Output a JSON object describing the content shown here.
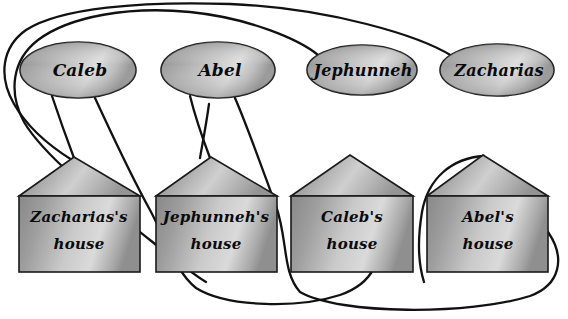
{
  "diagram": {
    "type": "bipartite-mapping",
    "background_color": "#ffffff",
    "line_color": "#111111",
    "shape_fill_light": "#d6d6d6",
    "shape_fill_dark": "#8a8a8a",
    "people": [
      {
        "id": "caleb",
        "label": "Caleb",
        "cx": 78,
        "cy": 70,
        "rx": 58,
        "ry": 28
      },
      {
        "id": "abel",
        "label": "Abel",
        "cx": 218,
        "cy": 70,
        "rx": 57,
        "ry": 28
      },
      {
        "id": "jephunneh",
        "label": "Jephunneh",
        "cx": 362,
        "cy": 70,
        "rx": 55,
        "ry": 25
      },
      {
        "id": "zacharias",
        "label": "Zacharias",
        "cx": 497,
        "cy": 70,
        "rx": 57,
        "ry": 26
      }
    ],
    "houses": [
      {
        "id": "zacharias-house",
        "owner": "Zacharias",
        "line1": "Zacharias's",
        "line2": "house",
        "left": 19,
        "right": 140,
        "apex_x": 74,
        "apex_y": 157,
        "eave_y": 196,
        "bottom_y": 272
      },
      {
        "id": "jephunneh-house",
        "owner": "Jephunneh",
        "line1": "Jephunneh's",
        "line2": "house",
        "left": 156,
        "right": 277,
        "apex_x": 211,
        "apex_y": 157,
        "eave_y": 196,
        "bottom_y": 272
      },
      {
        "id": "caleb-house",
        "owner": "Caleb",
        "line1": "Caleb's",
        "line2": "house",
        "left": 291,
        "right": 413,
        "apex_x": 350,
        "apex_y": 155,
        "eave_y": 196,
        "bottom_y": 272
      },
      {
        "id": "abel-house",
        "owner": "Abel",
        "line1": "Abel's",
        "line2": "house",
        "left": 427,
        "right": 548,
        "apex_x": 483,
        "apex_y": 155,
        "eave_y": 196,
        "bottom_y": 272
      }
    ],
    "connections": [
      {
        "id": "caleb-to-caleb-house",
        "from": "Caleb",
        "to": "Caleb's house"
      },
      {
        "id": "abel-to-abel-house",
        "from": "Abel",
        "to": "Abel's house"
      },
      {
        "id": "jephunneh-to-jephunneh-house",
        "from": "Jephunneh",
        "to": "Jephunneh's house"
      },
      {
        "id": "zacharias-to-zacharias-house",
        "from": "Zacharias",
        "to": "Zacharias's house"
      }
    ]
  }
}
